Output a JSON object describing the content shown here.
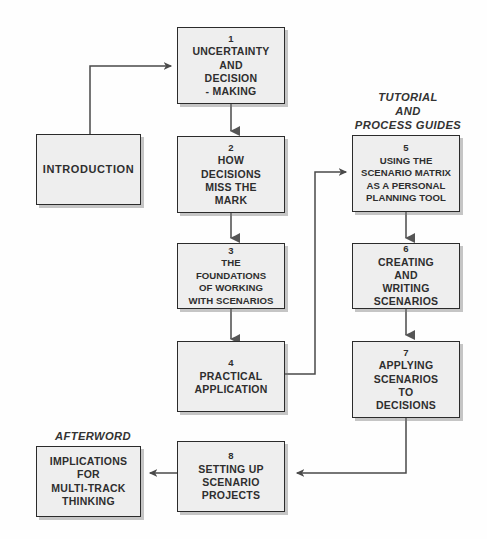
{
  "diagram": {
    "colors": {
      "node_fill": "#eeeeee",
      "node_border": "#2b2b2b",
      "connector": "#4a4a4a",
      "text": "#2e2e2e",
      "background": "#fefefe"
    },
    "captions": [
      {
        "name": "tutorial-and-process-guides",
        "lines": [
          "TUTORIAL",
          "AND",
          "PROCESS GUIDES"
        ]
      },
      {
        "name": "afterword",
        "lines": [
          "AFTERWORD"
        ]
      }
    ],
    "nodes": [
      {
        "name": "introduction",
        "number": "",
        "lines": [
          "INTRODUCTION"
        ]
      },
      {
        "name": "chapter-1",
        "number": "1",
        "lines": [
          "UNCERTAINTY",
          "AND",
          "DECISION",
          "- MAKING"
        ]
      },
      {
        "name": "chapter-2",
        "number": "2",
        "lines": [
          "HOW",
          "DECISIONS",
          "MISS THE",
          "MARK"
        ]
      },
      {
        "name": "chapter-3",
        "number": "3",
        "lines": [
          "THE",
          "FOUNDATIONS",
          "OF WORKING",
          "WITH SCENARIOS"
        ]
      },
      {
        "name": "chapter-4",
        "number": "4",
        "lines": [
          "PRACTICAL",
          "APPLICATION"
        ]
      },
      {
        "name": "chapter-5",
        "number": "5",
        "lines": [
          "USING THE",
          "SCENARIO MATRIX",
          "AS A PERSONAL",
          "PLANNING TOOL"
        ]
      },
      {
        "name": "chapter-6",
        "number": "6",
        "lines": [
          "CREATING",
          "AND",
          "WRITING",
          "SCENARIOS"
        ]
      },
      {
        "name": "chapter-7",
        "number": "7",
        "lines": [
          "APPLYING",
          "SCENARIOS",
          "TO",
          "DECISIONS"
        ]
      },
      {
        "name": "chapter-8",
        "number": "8",
        "lines": [
          "SETTING UP",
          "SCENARIO",
          "PROJECTS"
        ]
      },
      {
        "name": "afterword-chapter",
        "number": "",
        "lines": [
          "IMPLICATIONS",
          "FOR",
          "MULTI-TRACK",
          "THINKING"
        ]
      }
    ],
    "connectors": [
      {
        "name": "introduction-to-chapter-1",
        "from": "introduction",
        "to": "chapter-1"
      },
      {
        "name": "chapter-1-to-chapter-2",
        "from": "chapter-1",
        "to": "chapter-2"
      },
      {
        "name": "chapter-2-to-chapter-3",
        "from": "chapter-2",
        "to": "chapter-3"
      },
      {
        "name": "chapter-3-to-chapter-4",
        "from": "chapter-3",
        "to": "chapter-4"
      },
      {
        "name": "chapter-4-to-chapter-5",
        "from": "chapter-4",
        "to": "chapter-5"
      },
      {
        "name": "chapter-5-to-chapter-6",
        "from": "chapter-5",
        "to": "chapter-6"
      },
      {
        "name": "chapter-6-to-chapter-7",
        "from": "chapter-6",
        "to": "chapter-7"
      },
      {
        "name": "chapter-7-to-chapter-8",
        "from": "chapter-7",
        "to": "chapter-8"
      },
      {
        "name": "chapter-8-to-afterword",
        "from": "chapter-8",
        "to": "afterword-chapter"
      }
    ]
  }
}
